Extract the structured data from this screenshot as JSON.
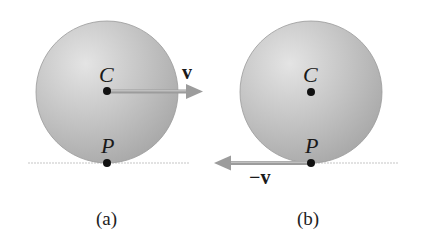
{
  "diagram": {
    "panels": [
      {
        "id": "a",
        "caption": "(a)",
        "center_label": "C",
        "contact_label": "P",
        "vector_label": "v",
        "vector_direction": "right",
        "vector_origin": "C"
      },
      {
        "id": "b",
        "caption": "(b)",
        "center_label": "C",
        "contact_label": "P",
        "vector_label": "−v",
        "vector_direction": "left",
        "vector_origin": "P"
      }
    ],
    "colors": {
      "disk": "#b8b8b8",
      "disk_highlight": "#e6e6e6",
      "arrow": "#999999",
      "ground": "#bdbdbd",
      "dot": "#111111"
    }
  }
}
